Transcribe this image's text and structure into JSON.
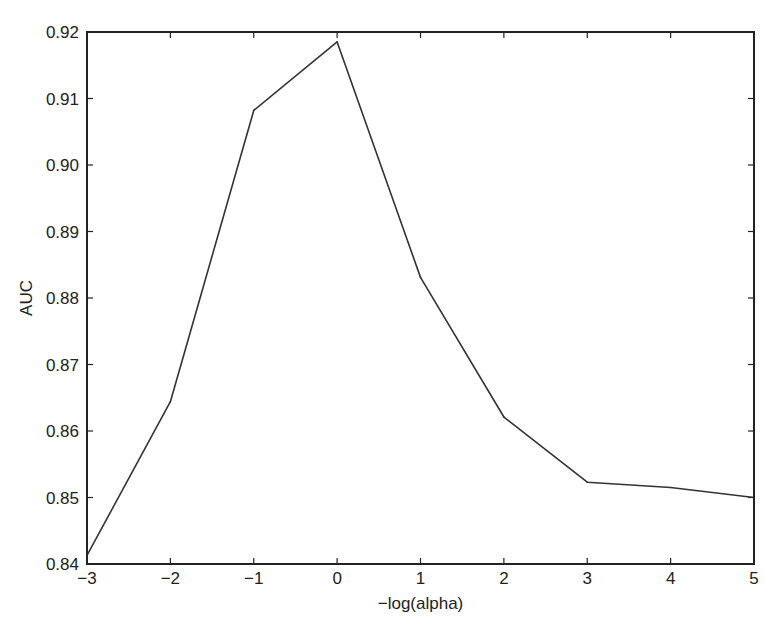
{
  "chart_data": {
    "type": "line",
    "title": "",
    "xlabel": "−log(alpha)",
    "ylabel": "AUC",
    "x": [
      -3,
      -2,
      -1,
      0,
      1,
      2,
      3,
      4,
      5
    ],
    "series": [
      {
        "name": "AUC",
        "color": "#333333",
        "values": [
          0.8413,
          0.8644,
          0.9082,
          0.9185,
          0.8831,
          0.8621,
          0.8523,
          0.8515,
          0.85
        ]
      }
    ],
    "xlim": [
      -3,
      5
    ],
    "ylim": [
      0.84,
      0.92
    ],
    "xticks": [
      -3,
      -2,
      -1,
      0,
      1,
      2,
      3,
      4,
      5
    ],
    "xtick_labels": [
      "−3",
      "−2",
      "−1",
      "0",
      "1",
      "2",
      "3",
      "4",
      "5"
    ],
    "yticks": [
      0.84,
      0.85,
      0.86,
      0.87,
      0.88,
      0.89,
      0.9,
      0.91,
      0.92
    ],
    "ytick_labels": [
      "0.84",
      "0.85",
      "0.86",
      "0.87",
      "0.88",
      "0.89",
      "0.90",
      "0.91",
      "0.92"
    ],
    "grid": false,
    "legend": "none"
  }
}
